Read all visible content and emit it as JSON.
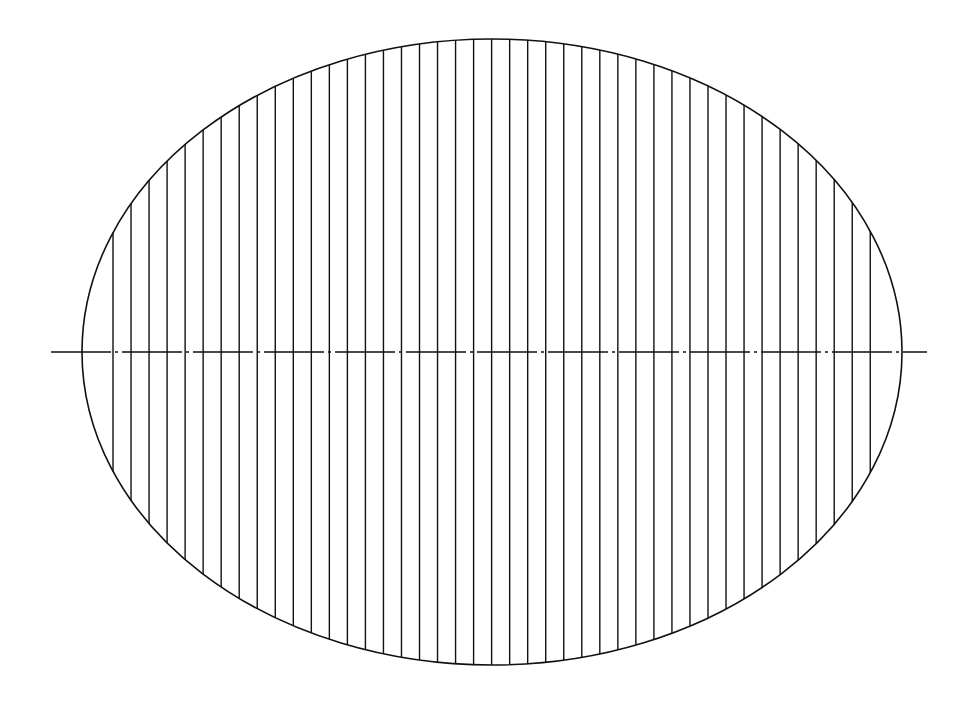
{
  "diagram": {
    "type": "hatched-ellipse",
    "background": "#ffffff",
    "stroke": "#111111",
    "ellipse": {
      "cx": 492,
      "cy": 352,
      "rx": 410,
      "ry": 313
    },
    "hatch": {
      "orientation": "vertical",
      "x_start": 113,
      "spacing": 18.03,
      "count": 43
    },
    "centerline": {
      "x1": 51,
      "x2": 927,
      "y": 352,
      "style": "dash-dot"
    }
  }
}
